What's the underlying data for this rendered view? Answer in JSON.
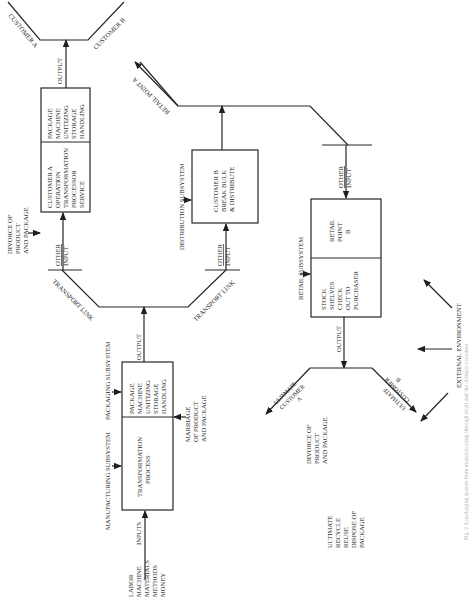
{
  "subsystems": {
    "manufacturing": "MANUFACTURING SUBSYSTEM",
    "packaging": "PACKAGING SUBSYSTEM",
    "distribution": "DISTRIBUTION SUBSYSTEM",
    "retail": "RETAIL SUBSYSTEM",
    "external": "EXTERNAL ENVIRONMENT"
  },
  "inputs": {
    "label": "INPUTS",
    "items": [
      "LABOR",
      "MACHINE",
      "MATERIALS",
      "METHODS",
      "MONEY"
    ]
  },
  "manufacturing_box": {
    "left": [
      "TRANSFORMATION",
      "PROCESS"
    ],
    "right": [
      "PACKAGE",
      "MACHINE",
      "UNITIZING",
      "STORAGE",
      "HANDLING"
    ]
  },
  "marriage_note": [
    "MARRIAGE",
    "OF PRODUCT",
    "AND PACKAGE"
  ],
  "output_label": "OUTPUT",
  "transport_link": "TRANSPORT LINK",
  "other_input": [
    "OTHER",
    "INPUT"
  ],
  "customer_a_box": {
    "left": [
      "CUSTOMER  A",
      "OPERATION",
      "TRANSFORMATION",
      "PROCESSOR",
      "SERVICE"
    ],
    "right": [
      "PACKAGE",
      "MACHINE",
      "UNITIZING",
      "STORAGE",
      "HANDLING"
    ]
  },
  "divorce_note_top": [
    "DIVORCE OF",
    "PRODUCT",
    "AND PACKAGE"
  ],
  "customer_a_outputs": [
    "CUSTOMER A",
    "CUSTOMER B"
  ],
  "customer_b_box": [
    "CUSTOMER B",
    "BREAK BULK",
    "& DISTRIBUTE"
  ],
  "retail_point_a": "RETAIL POINT A",
  "retail_box": {
    "left": [
      "STOCK",
      "SHELVES",
      "CHECK",
      "OUT TO",
      "PURCHASER"
    ],
    "right": [
      "RETAIL",
      "POINT",
      "B"
    ]
  },
  "ultimate_customers": {
    "a": [
      "ULTIMATE",
      "CUSTOMER",
      "A"
    ],
    "b": [
      "ULTIMATE",
      "CUSTOMER",
      "B"
    ]
  },
  "divorce_note_bottom": [
    "DIVORCE OF",
    "PRODUCT",
    "AND PACKAGE"
  ],
  "ultimate_disposal": [
    "ULTIMATE",
    "RECYCLE",
    "REUSE",
    "DISPOSE OF",
    "PACKAGE"
  ],
  "caption": "Fig. 2  A packaging system from manufacturing through retail and the ultimate customer"
}
